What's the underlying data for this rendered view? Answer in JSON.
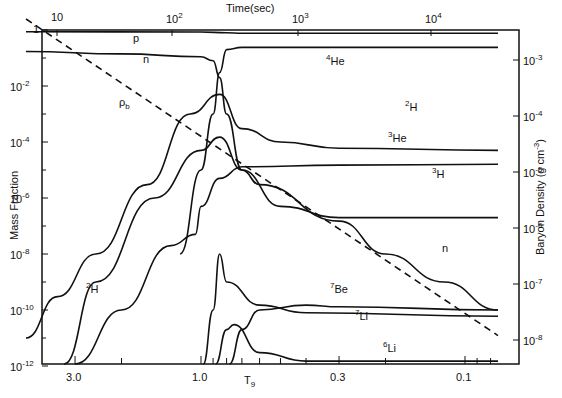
{
  "chart_data": {
    "type": "line",
    "title": "",
    "xlabel": "T9",
    "x_top_label": "Time(sec)",
    "ylabel": "Mass Fraction",
    "y2label": "Baryon Density (g cm-3)",
    "x_axis": {
      "scale": "log",
      "reversed": true,
      "range": [
        4.6,
        0.075
      ],
      "ticks": [
        {
          "value": 3.0,
          "label": "3.0"
        },
        {
          "value": 1.0,
          "label": "1.0"
        },
        {
          "value": 0.3,
          "label": "0.3"
        },
        {
          "value": 0.1,
          "label": "0.1"
        }
      ]
    },
    "x_top_axis": {
      "scale": "log",
      "ticks": [
        {
          "value": 10,
          "label": "10"
        },
        {
          "value": 100,
          "label": "10^2"
        },
        {
          "value": 1000,
          "label": "10^3"
        },
        {
          "value": 10000,
          "label": "10^4"
        }
      ]
    },
    "y_axis": {
      "scale": "log",
      "range": [
        1e-12,
        1
      ],
      "ticks": [
        {
          "value": 1,
          "label": "1"
        },
        {
          "value": 0.01,
          "label": "10^-2"
        },
        {
          "value": 0.0001,
          "label": "10^-4"
        },
        {
          "value": 1e-06,
          "label": "10^-6"
        },
        {
          "value": 1e-08,
          "label": "10^-8"
        },
        {
          "value": 1e-10,
          "label": "10^-10"
        },
        {
          "value": 1e-12,
          "label": "10^-12"
        }
      ]
    },
    "y2_axis": {
      "scale": "log",
      "ticks": [
        {
          "value": 0.001,
          "label": "10^-3"
        },
        {
          "value": 0.0001,
          "label": "10^-4"
        },
        {
          "value": 1e-05,
          "label": "10^-5"
        },
        {
          "value": 1e-06,
          "label": "10^-6"
        },
        {
          "value": 1e-07,
          "label": "10^-7"
        },
        {
          "value": 1e-08,
          "label": "10^-8"
        }
      ]
    },
    "grid": false,
    "legend": "inline labels",
    "series": [
      {
        "name": "p",
        "axis": "left",
        "style": "solid",
        "points": [
          [
            4.6,
            0.87
          ],
          [
            1.0,
            0.85
          ],
          [
            0.8,
            0.8
          ],
          [
            0.7,
            0.77
          ],
          [
            0.075,
            0.76
          ]
        ]
      },
      {
        "name": "n",
        "axis": "left",
        "style": "solid",
        "points": [
          [
            4.6,
            0.17
          ],
          [
            2.0,
            0.14
          ],
          [
            1.0,
            0.11
          ],
          [
            0.9,
            0.08
          ],
          [
            0.85,
            0.02
          ],
          [
            0.8,
            0.001
          ],
          [
            0.7,
            1e-05
          ],
          [
            0.6,
            3e-06
          ],
          [
            0.3,
            1.5e-07
          ],
          [
            0.2,
            1e-08
          ],
          [
            0.12,
            1e-09
          ],
          [
            0.075,
            1e-10
          ]
        ]
      },
      {
        "name": "4He",
        "axis": "left",
        "style": "solid",
        "points": [
          [
            1.2,
            1e-08
          ],
          [
            1.0,
            1e-05
          ],
          [
            0.9,
            0.001
          ],
          [
            0.85,
            0.03
          ],
          [
            0.8,
            0.2
          ],
          [
            0.7,
            0.24
          ],
          [
            0.075,
            0.24
          ]
        ]
      },
      {
        "name": "2H",
        "axis": "left",
        "style": "solid",
        "points": [
          [
            4.6,
            1e-11
          ],
          [
            3.5,
            3e-10
          ],
          [
            2.5,
            1e-08
          ],
          [
            1.6,
            3e-06
          ],
          [
            1.1,
            0.001
          ],
          [
            0.85,
            0.005
          ],
          [
            0.7,
            0.0003
          ],
          [
            0.5,
            0.0001
          ],
          [
            0.3,
            6e-05
          ],
          [
            0.075,
            5e-05
          ]
        ]
      },
      {
        "name": "3He",
        "axis": "left",
        "style": "solid",
        "points": [
          [
            3.3,
            1e-12
          ],
          [
            2.5,
            1e-09
          ],
          [
            1.5,
            1e-06
          ],
          [
            1.0,
            5e-05
          ],
          [
            0.85,
            0.00015
          ],
          [
            0.7,
            1e-05
          ],
          [
            0.5,
            5e-07
          ],
          [
            0.3,
            2e-07
          ],
          [
            0.075,
            2e-07
          ]
        ]
      },
      {
        "name": "3H",
        "axis": "left",
        "style": "solid",
        "points": [
          [
            3.0,
            1e-12
          ],
          [
            2.0,
            1e-10
          ],
          [
            1.3,
            2e-08
          ],
          [
            1.05,
            5e-08
          ],
          [
            1.0,
            5e-07
          ],
          [
            0.85,
            5e-06
          ],
          [
            0.7,
            1.3e-05
          ],
          [
            0.3,
            1.5e-05
          ],
          [
            0.075,
            1.6e-05
          ]
        ]
      },
      {
        "name": "7Be",
        "axis": "left",
        "style": "solid",
        "points": [
          [
            0.98,
            1e-12
          ],
          [
            0.9,
            1e-10
          ],
          [
            0.85,
            1e-08
          ],
          [
            0.8,
            1e-09
          ],
          [
            0.6,
            1.5e-10
          ],
          [
            0.4,
            8e-11
          ],
          [
            0.075,
            6e-11
          ]
        ]
      },
      {
        "name": "7Li",
        "axis": "left",
        "style": "solid",
        "points": [
          [
            0.78,
            1e-12
          ],
          [
            0.7,
            2e-11
          ],
          [
            0.6,
            1e-10
          ],
          [
            0.4,
            1.5e-10
          ],
          [
            0.3,
            1.3e-10
          ],
          [
            0.075,
            1e-10
          ]
        ]
      },
      {
        "name": "6Li",
        "axis": "left",
        "style": "solid",
        "points": [
          [
            0.88,
            1e-12
          ],
          [
            0.8,
            2e-11
          ],
          [
            0.75,
            3e-11
          ],
          [
            0.6,
            3e-12
          ],
          [
            0.4,
            1.5e-12
          ],
          [
            0.075,
            1.5e-12
          ]
        ]
      },
      {
        "name": "ρb",
        "axis": "right",
        "style": "dashed",
        "points": [
          [
            4.6,
            0.0054
          ],
          [
            0.075,
            1.2e-08
          ]
        ]
      }
    ],
    "annotations": [
      "p",
      "n",
      "4He",
      "2H",
      "3He",
      "3H",
      "n",
      "7Be",
      "7Li",
      "6Li",
      "2H",
      "ρb"
    ]
  },
  "labels": {
    "top_axis_title": "Time(sec)",
    "left_axis_title": "Mass Fraction",
    "right_axis_title": "Baryon Density (g cm",
    "right_axis_title_sup": "-3",
    "right_axis_title_end": ")",
    "bottom_axis_title": "T",
    "bottom_axis_title_sub": "9"
  }
}
